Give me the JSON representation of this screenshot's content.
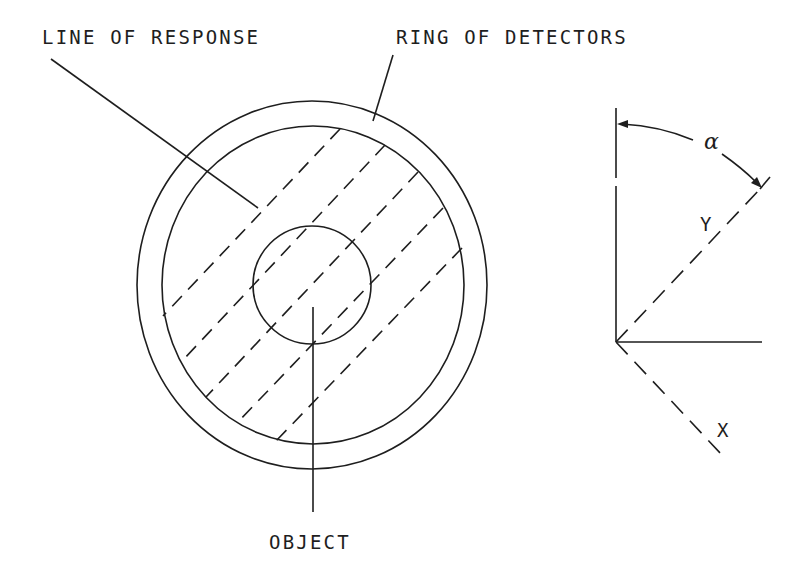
{
  "diagram": {
    "labels": {
      "line_of_response": "LINE OF RESPONSE",
      "ring_of_detectors": "RING OF DETECTORS",
      "object": "OBJECT"
    },
    "axes": {
      "angle_symbol": "α",
      "y_label": "Y",
      "x_label": "X"
    },
    "colors": {
      "ink": "#1e1e1e",
      "background": "#ffffff"
    },
    "geometry": {
      "outer_ring": {
        "cx": 312,
        "cy": 285,
        "rx": 175,
        "ry": 184
      },
      "inner_ring": {
        "cx": 313,
        "cy": 285,
        "rx": 151,
        "ry": 159
      },
      "object_circle": {
        "cx": 312,
        "cy": 285,
        "r": 59
      },
      "lines_of_response_count": 5
    }
  }
}
